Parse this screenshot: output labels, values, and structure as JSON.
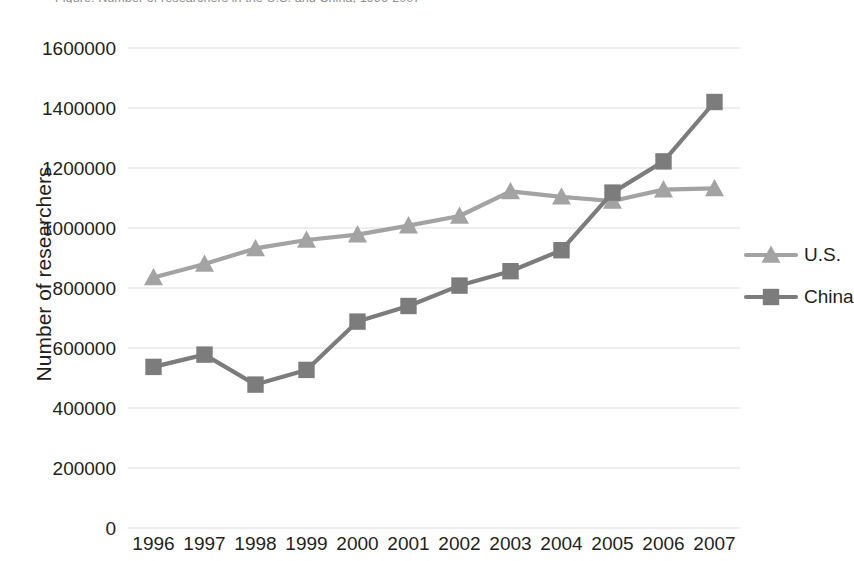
{
  "title_clipped": "Figure: Number of researchers in the U.S. and China, 1996-2007",
  "axis": {
    "y_title": "Number of researchers",
    "y_ticks": [
      "1600000",
      "1400000",
      "1200000",
      "1000000",
      "800000",
      "600000",
      "400000",
      "200000",
      "0"
    ],
    "x_ticks": [
      "1996",
      "1997",
      "1998",
      "1999",
      "2000",
      "2001",
      "2002",
      "2003",
      "2004",
      "2005",
      "2006",
      "2007"
    ]
  },
  "legend": {
    "entries": [
      {
        "label": "U.S.",
        "marker": "triangle-marker",
        "color": "#a3a3a3"
      },
      {
        "label": "China",
        "marker": "square-marker",
        "color": "#7c7c7c"
      }
    ]
  },
  "colors": {
    "us_series": "#a3a3a3",
    "china_series": "#7c7c7c",
    "gridline": "#e8e8e8",
    "text": "#231f20",
    "background": "#ffffff"
  },
  "chart_data": {
    "type": "line",
    "title": "Number of researchers in the U.S. and China, 1996-2007",
    "xlabel": "",
    "ylabel": "Number of researchers",
    "x": [
      "1996",
      "1997",
      "1998",
      "1999",
      "2000",
      "2001",
      "2002",
      "2003",
      "2004",
      "2005",
      "2006",
      "2007"
    ],
    "ylim": [
      0,
      1600000
    ],
    "ytick_step": 200000,
    "grid": true,
    "legend_position": "right",
    "series": [
      {
        "name": "U.S.",
        "marker": "triangle",
        "color": "#a3a3a3",
        "values": [
          835000,
          880000,
          932000,
          960000,
          978000,
          1008000,
          1040000,
          1122000,
          1104000,
          1090000,
          1128000,
          1132000
        ]
      },
      {
        "name": "China",
        "marker": "square",
        "color": "#7c7c7c",
        "values": [
          537000,
          578000,
          478000,
          527000,
          688000,
          740000,
          808000,
          856000,
          926000,
          1118000,
          1222000,
          1420000
        ]
      }
    ]
  }
}
